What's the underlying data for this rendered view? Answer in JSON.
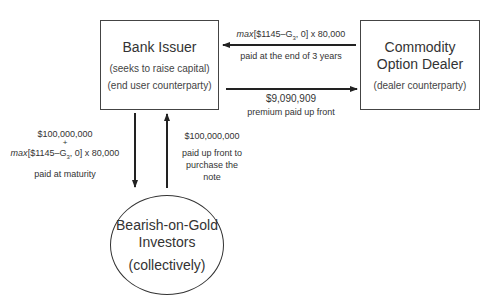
{
  "nodes": {
    "bank_issuer": {
      "title": "Bank Issuer",
      "lines": [
        "(seeks to raise capital)",
        "(end user counterparty)"
      ]
    },
    "dealer": {
      "title_line1": "Commodity",
      "title_line2": "Option Dealer",
      "lines": [
        "(dealer counterparty)"
      ]
    },
    "investors": {
      "title_line1": "Bearish-on-Gold",
      "title_line2": "Investors",
      "lines": [
        "(collectively)"
      ]
    }
  },
  "flows": {
    "dealer_to_bank": {
      "formula_prefix": "max",
      "formula_rest": "[$1145–G",
      "subscript": "3",
      "formula_tail": ", 0] x 80,000",
      "note": "paid at the end of 3 years"
    },
    "bank_to_dealer": {
      "amount": "$9,090,909",
      "note": "premium paid up front"
    },
    "bank_to_investors": {
      "amount": "$100,000,000",
      "plus": "+",
      "formula_prefix": "max",
      "formula_rest": "[$1145–G",
      "subscript": "3",
      "formula_tail": ", 0] x 80,000",
      "note": "paid at maturity"
    },
    "investors_to_bank": {
      "amount": "$100,000,000",
      "note_line1": "paid up front to",
      "note_line2": "purchase the",
      "note_line3": "note"
    }
  },
  "colors": {
    "line": "#333333",
    "text": "#333333",
    "background": "#ffffff"
  }
}
